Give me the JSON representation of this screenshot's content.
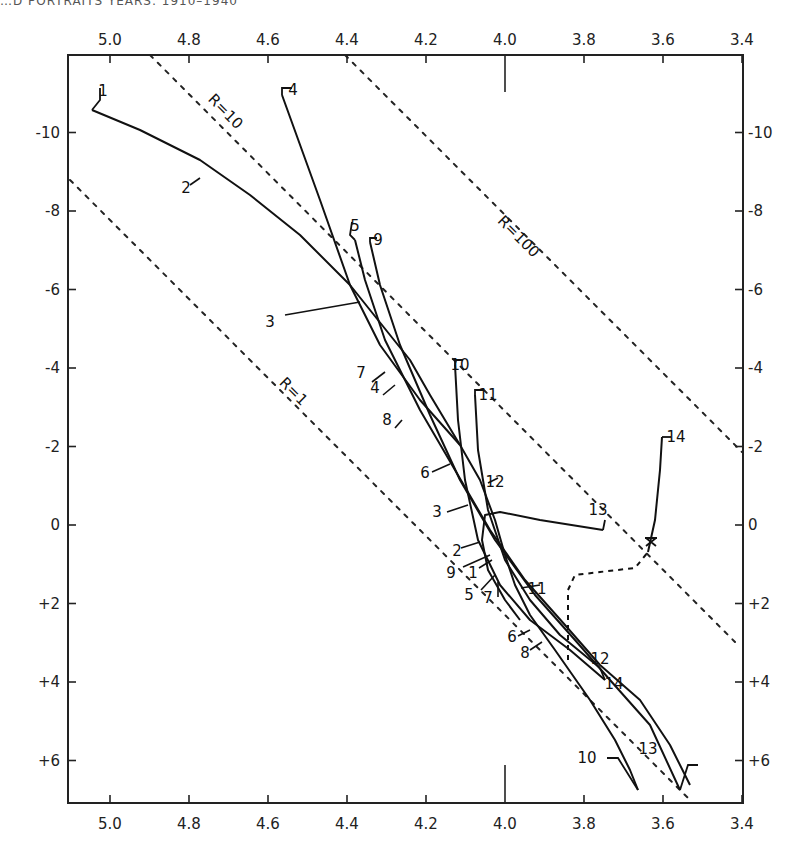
{
  "header": {
    "text": "…D PORTRAITS YEARS: 1910–1940"
  },
  "chart_data": {
    "type": "line",
    "title": "",
    "xlabel": "log Te",
    "ylabel": "Mbol",
    "x_axis": {
      "ticks": [
        "5.0",
        "4.8",
        "4.6",
        "4.4",
        "4.2",
        "4.0",
        "3.8",
        "3.6",
        "3.4"
      ],
      "values": [
        5.0,
        4.8,
        4.6,
        4.4,
        4.2,
        4.0,
        3.8,
        3.6,
        3.4
      ],
      "range": [
        5.1,
        3.4
      ],
      "reversed": true,
      "shown_top_and_bottom": true
    },
    "y_axis": {
      "ticks": [
        "-10",
        "-8",
        "-6",
        "-4",
        "-2",
        "0",
        "+2",
        "+4",
        "+6"
      ],
      "values": [
        -10,
        -8,
        -6,
        -4,
        -2,
        0,
        2,
        4,
        6
      ],
      "range": [
        -11.9,
        7.0
      ],
      "reversed": true,
      "shown_left_and_right": true
    },
    "grid": false,
    "radius_lines": [
      {
        "label": "R=1",
        "points_px": [
          [
            70,
            180
          ],
          [
            690,
            800
          ]
        ],
        "label_pos": [
          290,
          395
        ],
        "style": "dotted"
      },
      {
        "label": "R=10",
        "points_px": [
          [
            150,
            55
          ],
          [
            735,
            642
          ]
        ],
        "label_pos": [
          222,
          115
        ],
        "style": "dotted"
      },
      {
        "label": "R=100",
        "points_px": [
          [
            345,
            55
          ],
          [
            742,
            452
          ]
        ],
        "label_pos": [
          515,
          240
        ],
        "style": "dotted"
      }
    ],
    "tracks": [
      {
        "name": "track-A",
        "labels": [
          "1",
          "2",
          "3",
          "7",
          "4",
          "8",
          "6",
          "3",
          "2",
          "9",
          "1",
          "5",
          "7",
          "6",
          "8",
          "10",
          "13"
        ],
        "points_px": [
          [
            92,
            110
          ],
          [
            140,
            130
          ],
          [
            200,
            160
          ],
          [
            250,
            195
          ],
          [
            300,
            235
          ],
          [
            350,
            285
          ],
          [
            390,
            335
          ],
          [
            410,
            360
          ],
          [
            430,
            395
          ],
          [
            460,
            445
          ],
          [
            480,
            480
          ],
          [
            495,
            520
          ],
          [
            505,
            555
          ],
          [
            515,
            585
          ],
          [
            530,
            615
          ],
          [
            555,
            650
          ],
          [
            590,
            700
          ],
          [
            615,
            740
          ],
          [
            630,
            770
          ],
          [
            638,
            790
          ]
        ],
        "description": "massive star track from upper left (1) descending to lower right"
      },
      {
        "name": "track-B",
        "points_px": [
          [
            282,
            95
          ],
          [
            320,
            200
          ],
          [
            350,
            285
          ],
          [
            380,
            345
          ],
          [
            420,
            400
          ],
          [
            460,
            445
          ]
        ],
        "start_label": "4"
      },
      {
        "name": "track-C",
        "points_px": [
          [
            355,
            240
          ],
          [
            365,
            280
          ],
          [
            385,
            340
          ],
          [
            420,
            410
          ],
          [
            455,
            470
          ],
          [
            490,
            530
          ],
          [
            525,
            580
          ],
          [
            565,
            625
          ],
          [
            600,
            665
          ],
          [
            640,
            700
          ],
          [
            670,
            745
          ],
          [
            690,
            785
          ]
        ],
        "start_label": "5"
      },
      {
        "name": "track-D",
        "points_px": [
          [
            370,
            242
          ],
          [
            380,
            285
          ],
          [
            400,
            345
          ],
          [
            430,
            415
          ],
          [
            460,
            480
          ],
          [
            495,
            540
          ],
          [
            535,
            595
          ],
          [
            575,
            640
          ],
          [
            610,
            680
          ],
          [
            650,
            725
          ],
          [
            680,
            790
          ]
        ],
        "start_label": "9"
      },
      {
        "name": "track-E",
        "points_px": [
          [
            455,
            365
          ],
          [
            458,
            420
          ],
          [
            465,
            480
          ],
          [
            478,
            540
          ],
          [
            500,
            585
          ],
          [
            530,
            620
          ],
          [
            570,
            650
          ],
          [
            605,
            680
          ]
        ],
        "start_label": "10"
      },
      {
        "name": "track-F",
        "points_px": [
          [
            475,
            395
          ],
          [
            478,
            450
          ],
          [
            488,
            510
          ],
          [
            505,
            560
          ],
          [
            530,
            600
          ],
          [
            560,
            635
          ],
          [
            600,
            668
          ]
        ],
        "start_label": "11"
      }
    ],
    "giant_branch": {
      "solid": [
        [
          603,
          530
        ],
        [
          540,
          520
        ],
        [
          500,
          512
        ],
        [
          485,
          515
        ],
        [
          482,
          540
        ],
        [
          488,
          570
        ],
        [
          505,
          600
        ],
        [
          520,
          620
        ]
      ],
      "dashed": [
        [
          568,
          660
        ],
        [
          568,
          590
        ],
        [
          575,
          575
        ],
        [
          600,
          572
        ],
        [
          635,
          568
        ],
        [
          648,
          552
        ]
      ],
      "to_14": [
        [
          648,
          552
        ],
        [
          655,
          520
        ],
        [
          660,
          470
        ],
        [
          662,
          437
        ]
      ],
      "labels": {
        "13": [
          598,
          515
        ],
        "14": [
          676,
          442
        ]
      },
      "cross_marker": [
        651,
        542
      ]
    },
    "curve_labels": [
      {
        "text": "1",
        "x": 103,
        "y": 96
      },
      {
        "text": "2",
        "x": 186,
        "y": 193
      },
      {
        "text": "3",
        "x": 270,
        "y": 327
      },
      {
        "text": "4",
        "x": 293,
        "y": 95
      },
      {
        "text": "5",
        "x": 355,
        "y": 231
      },
      {
        "text": "9",
        "x": 378,
        "y": 245
      },
      {
        "text": "7",
        "x": 361,
        "y": 378
      },
      {
        "text": "4",
        "x": 375,
        "y": 393
      },
      {
        "text": "8",
        "x": 387,
        "y": 425
      },
      {
        "text": "10",
        "x": 460,
        "y": 370
      },
      {
        "text": "11",
        "x": 488,
        "y": 400
      },
      {
        "text": "6",
        "x": 425,
        "y": 478
      },
      {
        "text": "12",
        "x": 495,
        "y": 487
      },
      {
        "text": "3",
        "x": 437,
        "y": 517
      },
      {
        "text": "13",
        "x": 598,
        "y": 515
      },
      {
        "text": "14",
        "x": 676,
        "y": 442
      },
      {
        "text": "2",
        "x": 457,
        "y": 556
      },
      {
        "text": "9",
        "x": 451,
        "y": 578
      },
      {
        "text": "1",
        "x": 473,
        "y": 578
      },
      {
        "text": "5",
        "x": 469,
        "y": 600
      },
      {
        "text": "7",
        "x": 488,
        "y": 603
      },
      {
        "text": "11",
        "x": 537,
        "y": 594
      },
      {
        "text": "6",
        "x": 512,
        "y": 642
      },
      {
        "text": "8",
        "x": 525,
        "y": 658
      },
      {
        "text": "12",
        "x": 600,
        "y": 664
      },
      {
        "text": "14",
        "x": 614,
        "y": 689
      },
      {
        "text": "10",
        "x": 587,
        "y": 763
      },
      {
        "text": "13",
        "x": 648,
        "y": 754
      }
    ]
  },
  "labels": {
    "r1": "R=1",
    "r10": "R=10",
    "r100": "R=100"
  }
}
